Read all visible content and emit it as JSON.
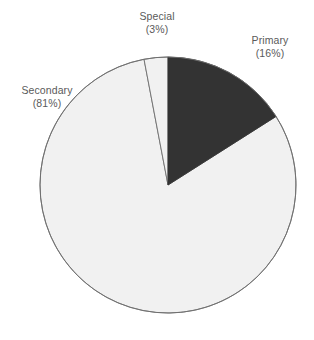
{
  "chart_data": {
    "type": "pie",
    "title": "",
    "labels": [
      "Primary",
      "Secondary",
      "Special"
    ],
    "values": [
      16,
      81,
      3
    ],
    "value_unit": "%",
    "legend": "none",
    "grid": false,
    "label_format": "{name}\n({value}%)",
    "start_angle_deg": 0,
    "direction": "clockwise",
    "colors": {
      "primary": "#333333",
      "secondary": "#f1f1f1",
      "special": "#f1f1f1",
      "outline": "#6e6e6e",
      "label_text": "#5a5a5a",
      "background": "#ffffff"
    },
    "slices": [
      {
        "name": "Primary",
        "value": 16,
        "label_name": "Primary",
        "label_pct": "(16%)",
        "fill": "#333333",
        "start_deg": 0,
        "end_deg": 57.6
      },
      {
        "name": "Secondary",
        "value": 81,
        "label_name": "Secondary",
        "label_pct": "(81%)",
        "fill": "#f1f1f1",
        "start_deg": 57.6,
        "end_deg": 349.2
      },
      {
        "name": "Special",
        "value": 3,
        "label_name": "Special",
        "label_pct": "(3%)",
        "fill": "#f1f1f1",
        "start_deg": 349.2,
        "end_deg": 360
      }
    ],
    "geometry": {
      "center_x": 168,
      "center_y": 185,
      "radius": 128
    }
  }
}
